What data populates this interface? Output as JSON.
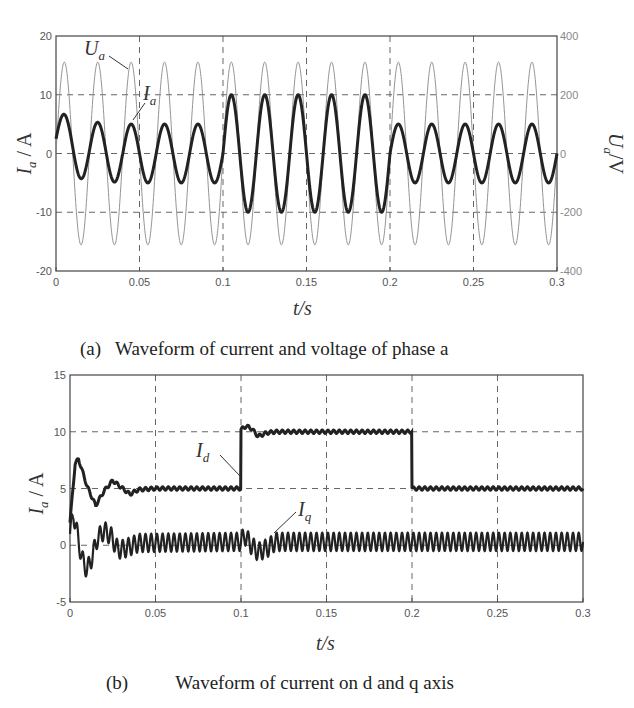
{
  "chart_data": [
    {
      "id": "a",
      "type": "line",
      "caption_label": "(a)",
      "caption_text": "Waveform of current and voltage of phase a",
      "xlabel": "t/s",
      "ylabel_left": "I_a / A",
      "ylabel_right": "U_a /V",
      "xlim": [
        0,
        0.3
      ],
      "ylim_left": [
        -20,
        20
      ],
      "ylim_right": [
        -400,
        400
      ],
      "xticks": [
        "0",
        "0.05",
        "0.1",
        "0.15",
        "0.2",
        "0.25",
        "0.3"
      ],
      "yticks_left": [
        "20",
        "10",
        "0",
        "-10",
        "-20"
      ],
      "yticks_right": [
        "400",
        "200",
        "0",
        "-200",
        "-400"
      ],
      "grid": true,
      "series": [
        {
          "name": "U_a",
          "axis": "right",
          "frequency_hz": 50,
          "amplitude": 311,
          "segments": [
            {
              "t0": 0,
              "t1": 0.3,
              "amplitude": 311
            }
          ]
        },
        {
          "name": "I_a",
          "axis": "left",
          "frequency_hz": 50,
          "segments": [
            {
              "t0": 0,
              "t1": 0.1,
              "amplitude": 5,
              "transient_first_peak": 7.5,
              "transient_first_trough": -3.5
            },
            {
              "t0": 0.1,
              "t1": 0.2,
              "amplitude": 10
            },
            {
              "t0": 0.2,
              "t1": 0.3,
              "amplitude": 5
            }
          ]
        }
      ],
      "annotations": [
        {
          "text": "U",
          "sub": "a",
          "x": 0.005,
          "y": 17
        },
        {
          "text": "I",
          "sub": "a",
          "x": 0.047,
          "y": 9
        }
      ]
    },
    {
      "id": "b",
      "type": "line",
      "caption_label": "(b)",
      "caption_text": "Waveform of current on d and q axis",
      "xlabel": "t/s",
      "ylabel_left": "I_a / A",
      "xlim": [
        0,
        0.3
      ],
      "ylim": [
        -5,
        15
      ],
      "xticks": [
        "0",
        "0.05",
        "0.1",
        "0.15",
        "0.2",
        "0.25",
        "0.3"
      ],
      "yticks": [
        "15",
        "10",
        "5",
        "0",
        "-5"
      ],
      "grid": true,
      "series": [
        {
          "name": "I_d",
          "x": [
            0,
            0.003,
            0.005,
            0.01,
            0.015,
            0.02,
            0.025,
            0.03,
            0.035,
            0.04,
            0.05,
            0.0999,
            0.1,
            0.103,
            0.106,
            0.11,
            0.115,
            0.12,
            0.1999,
            0.2,
            0.3
          ],
          "y": [
            2,
            7.2,
            7.6,
            5.2,
            3.5,
            4.8,
            5.7,
            5.1,
            4.5,
            4.9,
            5.0,
            5.0,
            10.2,
            10.5,
            10.3,
            9.6,
            9.9,
            10.0,
            10.0,
            5.0,
            5.0
          ]
        },
        {
          "name": "I_q",
          "x": [
            0,
            0.002,
            0.004,
            0.007,
            0.01,
            0.013,
            0.016,
            0.02,
            0.024,
            0.028,
            0.032,
            0.04,
            0.1,
            0.102,
            0.106,
            0.11,
            0.116,
            0.12,
            0.3
          ],
          "y": [
            1,
            2.8,
            1.2,
            -1.2,
            -2.2,
            -1.0,
            0.6,
            1.3,
            0.8,
            -0.4,
            -0.3,
            0.2,
            0.3,
            0.9,
            0,
            -0.6,
            -0.2,
            0.3,
            0.3
          ],
          "ripple": 0.8
        }
      ],
      "annotations": [
        {
          "text": "I",
          "sub": "d",
          "x": 0.083,
          "y": 7.6
        },
        {
          "text": "I",
          "sub": "q",
          "x": 0.13,
          "y": 2.2
        }
      ]
    }
  ],
  "captions": {
    "a_label": "(a)",
    "a_text": "Waveform of current and voltage of phase a",
    "b_label": "(b)",
    "b_text": "Waveform of current on d and q axis"
  },
  "axes": {
    "xlabel": "t/s",
    "ylabel_main": "I",
    "ylabel_main_sub": "a",
    "ylabel_unit": " / A",
    "ylabel_right": "U",
    "ylabel_right_sub": "a",
    "ylabel_right_unit": "/V"
  }
}
